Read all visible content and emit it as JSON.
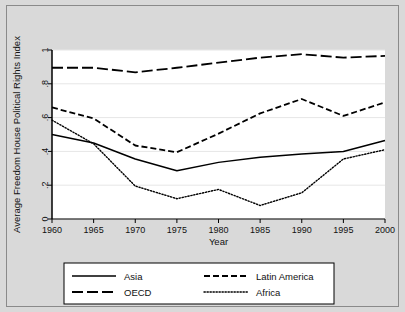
{
  "figure": {
    "background_color": "#d9d9d9",
    "plot_background_color": "#ffffff",
    "border_color": "#8a8a8a"
  },
  "chart_data": {
    "type": "line",
    "title": "",
    "xlabel": "Year",
    "ylabel": "Average Freedom House Political Rights Index",
    "x": [
      1960,
      1965,
      1970,
      1975,
      1980,
      1985,
      1990,
      1995,
      2000
    ],
    "xlim": [
      1960,
      2000
    ],
    "ylim": [
      0,
      1
    ],
    "xticks": [
      1960,
      1965,
      1970,
      1975,
      1980,
      1985,
      1990,
      1995,
      2000
    ],
    "xtick_labels": [
      "1960",
      "1965",
      "1970",
      "1975",
      "1980",
      "1985",
      "1990",
      "1995",
      "2000"
    ],
    "yticks": [
      0,
      0.2,
      0.4,
      0.6,
      0.8,
      1.0
    ],
    "ytick_labels": [
      "0",
      ".2",
      ".4",
      ".6",
      ".8",
      "1"
    ],
    "grid": true,
    "grid_axis": "y",
    "legend_position": "below-plot",
    "legend_columns": 2,
    "series": [
      {
        "name": "Asia",
        "style": "solid",
        "color": "#000000",
        "values": [
          0.5,
          0.45,
          0.355,
          0.285,
          0.335,
          0.365,
          0.385,
          0.4,
          0.465
        ]
      },
      {
        "name": "Latin America",
        "style": "dashed",
        "color": "#000000",
        "values": [
          0.66,
          0.595,
          0.435,
          0.395,
          0.505,
          0.625,
          0.71,
          0.61,
          0.69
        ]
      },
      {
        "name": "OECD",
        "style": "long-dashed",
        "color": "#000000",
        "values": [
          0.895,
          0.895,
          0.868,
          0.895,
          0.925,
          0.955,
          0.975,
          0.955,
          0.965
        ]
      },
      {
        "name": "Africa",
        "style": "dotted",
        "color": "#000000",
        "values": [
          0.585,
          0.445,
          0.195,
          0.12,
          0.175,
          0.08,
          0.155,
          0.355,
          0.41
        ]
      }
    ]
  },
  "legend": {
    "entries": [
      {
        "label": "Asia",
        "style": "solid"
      },
      {
        "label": "Latin America",
        "style": "dashed"
      },
      {
        "label": "OECD",
        "style": "long-dashed"
      },
      {
        "label": "Africa",
        "style": "dotted"
      }
    ]
  }
}
